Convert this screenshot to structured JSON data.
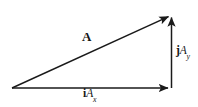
{
  "figure": {
    "background_color": "#ffffff",
    "stroke_color": "#1a1a1a"
  },
  "labels": {
    "resultant": {
      "name": "resultant-vector-label",
      "text": "A",
      "style": "bold"
    },
    "x_component": {
      "name": "x-component-label",
      "unit_vector": "i",
      "magnitude": "A",
      "subscript": "x"
    },
    "y_component": {
      "name": "y-component-label",
      "unit_vector": "j",
      "magnitude": "A",
      "subscript": "y"
    }
  },
  "geometry": {
    "origin": {
      "x": 12,
      "y": 88
    },
    "tip": {
      "x": 172,
      "y": 14
    },
    "corner": {
      "x": 172,
      "y": 88
    },
    "arrows": [
      {
        "name": "resultant-arrow",
        "from": [
          12,
          88
        ],
        "to": [
          172,
          14
        ]
      },
      {
        "name": "x-component-arrow",
        "from": [
          12,
          88
        ],
        "to": [
          172,
          88
        ]
      },
      {
        "name": "y-component-arrow",
        "from": [
          172,
          88
        ],
        "to": [
          172,
          14
        ]
      }
    ]
  }
}
